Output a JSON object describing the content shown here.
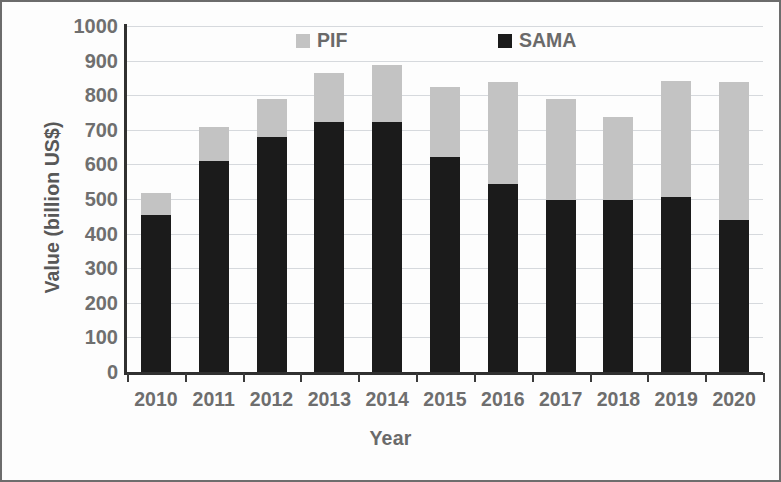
{
  "chart_data": {
    "type": "bar",
    "subtype": "stacked-bar",
    "title": "",
    "xlabel": "Year",
    "ylabel": "Value (billion US$)",
    "categories": [
      "2010",
      "2011",
      "2012",
      "2013",
      "2014",
      "2015",
      "2016",
      "2017",
      "2018",
      "2019",
      "2020"
    ],
    "series": [
      {
        "name": "SAMA",
        "color": "#1b1b1b",
        "values": [
          453,
          610,
          679,
          723,
          723,
          622,
          544,
          497,
          497,
          506,
          439
        ]
      },
      {
        "name": "PIF",
        "color": "#c3c3c3",
        "values": [
          64,
          98,
          110,
          141,
          165,
          203,
          294,
          293,
          239,
          336,
          399
        ]
      }
    ],
    "totals": [
      517,
      708,
      789,
      864,
      888,
      825,
      838,
      790,
      736,
      842,
      838
    ],
    "ylim": [
      0,
      1000
    ],
    "ytick_labels": [
      "0",
      "100",
      "200",
      "300",
      "400",
      "500",
      "600",
      "700",
      "800",
      "900",
      "1000"
    ],
    "ytick_values": [
      0,
      100,
      200,
      300,
      400,
      500,
      600,
      700,
      800,
      900,
      1000
    ],
    "grid": true,
    "grid_axis": "y",
    "legend": {
      "position": "top",
      "entries": [
        {
          "label": "PIF",
          "color": "#c3c3c3"
        },
        {
          "label": "SAMA",
          "color": "#1b1b1b"
        }
      ]
    },
    "stack_order": [
      "SAMA",
      "PIF"
    ]
  }
}
